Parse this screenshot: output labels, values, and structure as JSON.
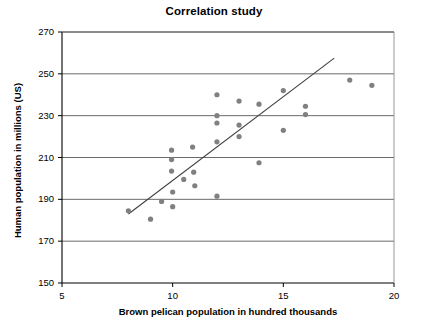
{
  "chart_data": {
    "type": "scatter",
    "title": "Correlation study",
    "xlabel": "Brown pelican population in hundred thousands",
    "ylabel": "Human population in millions (US)",
    "xlim": [
      5,
      20
    ],
    "ylim": [
      150,
      270
    ],
    "xticks": [
      5,
      10,
      15,
      20
    ],
    "yticks": [
      150,
      170,
      190,
      210,
      230,
      250,
      270
    ],
    "grid": "horizontal",
    "legend": "none",
    "marker_color": "#808080",
    "trendline_color": "#404040",
    "axis_color": "#000000",
    "points": [
      {
        "x": 8.0,
        "y": 184.5
      },
      {
        "x": 9.0,
        "y": 180.5
      },
      {
        "x": 9.5,
        "y": 189.0
      },
      {
        "x": 9.95,
        "y": 213.5
      },
      {
        "x": 9.95,
        "y": 209.0
      },
      {
        "x": 9.95,
        "y": 203.5
      },
      {
        "x": 10.0,
        "y": 193.5
      },
      {
        "x": 10.0,
        "y": 186.5
      },
      {
        "x": 10.5,
        "y": 199.5
      },
      {
        "x": 10.9,
        "y": 215.0
      },
      {
        "x": 10.95,
        "y": 203.0
      },
      {
        "x": 11.0,
        "y": 196.5
      },
      {
        "x": 12.0,
        "y": 240.0
      },
      {
        "x": 12.0,
        "y": 230.0
      },
      {
        "x": 12.0,
        "y": 226.5
      },
      {
        "x": 12.0,
        "y": 217.5
      },
      {
        "x": 12.0,
        "y": 191.5
      },
      {
        "x": 13.0,
        "y": 237.0
      },
      {
        "x": 13.0,
        "y": 225.5
      },
      {
        "x": 13.0,
        "y": 220.0
      },
      {
        "x": 13.9,
        "y": 235.5
      },
      {
        "x": 13.9,
        "y": 207.5
      },
      {
        "x": 15.0,
        "y": 242.0
      },
      {
        "x": 15.0,
        "y": 223.0
      },
      {
        "x": 16.0,
        "y": 234.5
      },
      {
        "x": 16.0,
        "y": 230.5
      },
      {
        "x": 18.0,
        "y": 247.0
      },
      {
        "x": 19.0,
        "y": 244.5
      }
    ],
    "trendline": {
      "x1": 8.0,
      "y1": 183.0,
      "x2": 17.3,
      "y2": 257.5
    }
  },
  "plot_geometry": {
    "left": 62,
    "right": 394,
    "top": 32,
    "bottom": 283,
    "marker_radius": 2.6,
    "trend_width": 1.1
  }
}
